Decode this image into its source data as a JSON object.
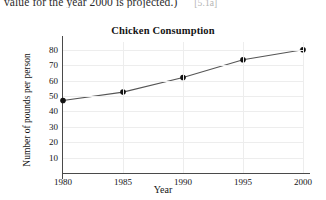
{
  "page": {
    "top_text": "value for the year 2000 is projected.)",
    "reference_tag": "[5.1a]"
  },
  "chart_data": {
    "type": "line",
    "title": "Chicken Consumption",
    "xlabel": "Year",
    "ylabel": "Number of pounds per person",
    "x": [
      1980,
      1985,
      1990,
      1995,
      2000
    ],
    "categories": [
      "1980",
      "1985",
      "1990",
      "1995",
      "2000"
    ],
    "values": [
      47,
      52.5,
      62,
      73.5,
      80
    ],
    "xtick_labels": [
      "1980",
      "1985",
      "1990",
      "1995",
      "2000"
    ],
    "ytick_labels": [
      "10",
      "20",
      "30",
      "40",
      "50",
      "60",
      "70",
      "80"
    ],
    "yticks": [
      10,
      20,
      30,
      40,
      50,
      60,
      70,
      80
    ],
    "xlim": [
      1980,
      2000
    ],
    "ylim": [
      0,
      85
    ],
    "grid": true,
    "legend": "none",
    "marker": "filled-circle",
    "line_color": "#555555",
    "marker_color": "#111111",
    "grid_color": "#ededed",
    "axis_color": "#4a4a4a"
  }
}
